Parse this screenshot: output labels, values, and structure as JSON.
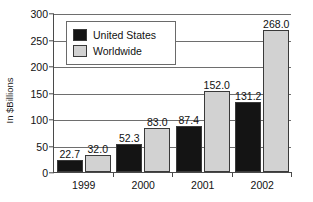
{
  "chart_data": {
    "type": "bar",
    "title": "",
    "xlabel": "",
    "ylabel": "In $Billions",
    "ylim": [
      0,
      300
    ],
    "yticks": [
      0,
      50,
      100,
      150,
      200,
      250,
      300
    ],
    "ytick_labels": [
      "0",
      "50",
      "100",
      "150",
      "200",
      "250",
      "300"
    ],
    "grid": true,
    "legend_position": "upper-left-inside",
    "categories": [
      "1999",
      "2000",
      "2001",
      "2002"
    ],
    "series": [
      {
        "name": "United States",
        "color": "#141414",
        "values": [
          22.7,
          52.3,
          87.4,
          131.2
        ],
        "labels": [
          "22.7",
          "52.3",
          "87.4",
          "131.2"
        ]
      },
      {
        "name": "Worldwide",
        "color": "#d2d2d2",
        "values": [
          32.0,
          83.0,
          152.0,
          268.0
        ],
        "labels": [
          "32.0",
          "83.0",
          "152.0",
          "268.0"
        ]
      }
    ]
  },
  "legend": {
    "items": [
      {
        "label": "United States",
        "swatch": "us"
      },
      {
        "label": "Worldwide",
        "swatch": "ww"
      }
    ]
  },
  "axes": {
    "y_title": "In $Billions"
  }
}
